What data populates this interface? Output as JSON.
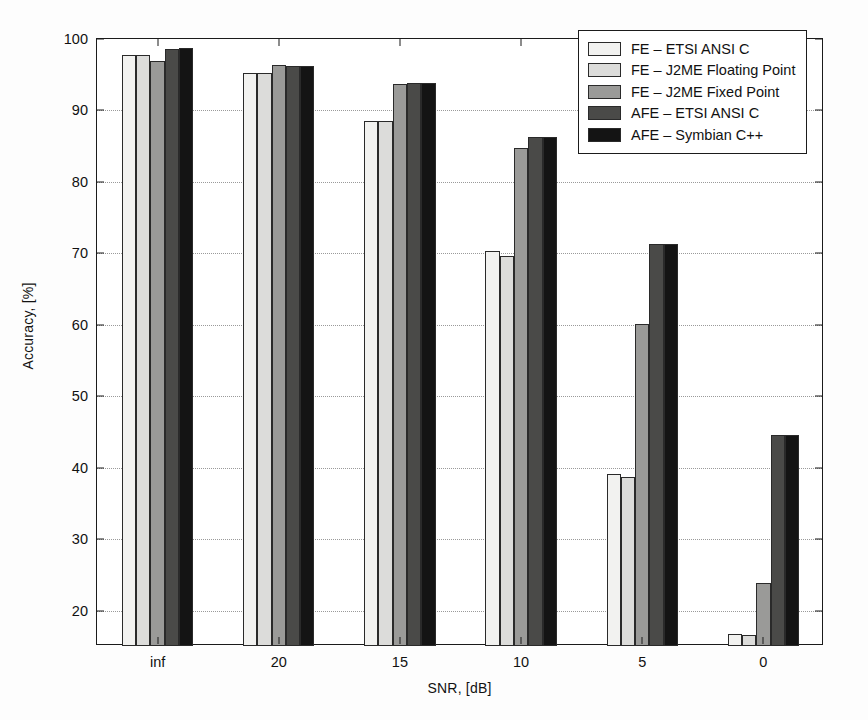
{
  "chart_data": {
    "type": "bar",
    "title": "",
    "xlabel": "SNR, [dB]",
    "ylabel": "Accuracy, [%]",
    "categories": [
      "inf",
      "20",
      "15",
      "10",
      "5",
      "0"
    ],
    "ylim": [
      15.1,
      100
    ],
    "yticks": [
      20,
      30,
      40,
      50,
      60,
      70,
      80,
      90,
      100
    ],
    "ytick_labels": [
      "20",
      "30",
      "40",
      "50",
      "60",
      "70",
      "80",
      "90",
      "100"
    ],
    "grid": true,
    "grid_style": "dotted",
    "legend_position": "upper right",
    "series": [
      {
        "name": "FE – ETSI ANSI C",
        "color": "#f2f2f0",
        "values": [
          97.8,
          95.2,
          88.5,
          70.3,
          39.2,
          16.8
        ]
      },
      {
        "name": "FE – J2ME Floating Point",
        "color": "#dcdcda",
        "values": [
          97.7,
          95.2,
          88.5,
          69.7,
          38.8,
          16.7
        ]
      },
      {
        "name": "FE – J2ME Fixed Point",
        "color": "#9a9a98",
        "values": [
          96.9,
          96.3,
          93.7,
          84.7,
          60.2,
          23.9
        ]
      },
      {
        "name": "AFE – ETSI ANSI C",
        "color": "#4a4a48",
        "values": [
          98.6,
          96.2,
          93.8,
          86.3,
          71.3,
          44.6
        ]
      },
      {
        "name": "AFE – Symbian C++",
        "color": "#141414",
        "values": [
          98.7,
          96.2,
          93.8,
          86.3,
          71.3,
          44.6
        ]
      }
    ]
  }
}
